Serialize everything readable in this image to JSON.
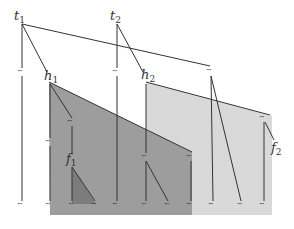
{
  "diagram": {
    "type": "tree-with-shaded-regions",
    "colors": {
      "dark_region": "#9a9a9a",
      "light_region": "#d9d9d9",
      "small_triangle": "#7a7a7a",
      "line": "#333333"
    },
    "labels": {
      "t1": {
        "base": "t",
        "sub": "1"
      },
      "t2": {
        "base": "t",
        "sub": "2"
      },
      "h1": {
        "base": "h",
        "sub": "1"
      },
      "h2": {
        "base": "h",
        "sub": "2"
      },
      "f1": {
        "base": "f",
        "sub": "1"
      },
      "f2": {
        "base": "f",
        "sub": "2"
      }
    },
    "ellipsis": "···",
    "nodes": [
      {
        "id": "t1",
        "x": 22,
        "y": 24,
        "label": "t1"
      },
      {
        "id": "t2",
        "x": 117,
        "y": 24,
        "label": "t2"
      },
      {
        "id": "d_t1",
        "x": 22,
        "y": 72,
        "label": "···"
      },
      {
        "id": "d_t2",
        "x": 117,
        "y": 72,
        "label": "···"
      },
      {
        "id": "h1",
        "x": 49,
        "y": 82,
        "label": "h1"
      },
      {
        "id": "h2",
        "x": 146,
        "y": 82,
        "label": "h2"
      },
      {
        "id": "d_right",
        "x": 211,
        "y": 72,
        "label": "···"
      },
      {
        "id": "d_h1a",
        "x": 72,
        "y": 122,
        "label": "···"
      },
      {
        "id": "d_h1b",
        "x": 50,
        "y": 142,
        "label": "···"
      },
      {
        "id": "d_h2a",
        "x": 146,
        "y": 157,
        "label": "···"
      },
      {
        "id": "d_h1c",
        "x": 191,
        "y": 157,
        "label": "···"
      },
      {
        "id": "d_f2",
        "x": 264,
        "y": 118,
        "label": "···"
      },
      {
        "id": "f1",
        "x": 72,
        "y": 167,
        "label": "f1"
      },
      {
        "id": "f2",
        "x": 274,
        "y": 150,
        "label": "f2"
      }
    ],
    "leaves_y": 205,
    "leaf_x": [
      22,
      50,
      73,
      96,
      117,
      146,
      169,
      191,
      213,
      242,
      264
    ]
  }
}
